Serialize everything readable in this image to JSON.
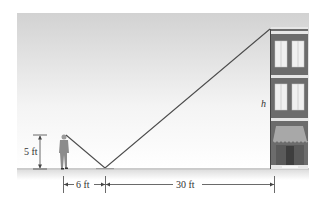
{
  "figure": {
    "type": "mirror-reflection similar triangles",
    "labels": {
      "person_height": "5 ft",
      "person_to_mirror": "6 ft",
      "mirror_to_building": "30 ft",
      "building_height": "h"
    },
    "colors": {
      "sky_top": "#d4d4d4",
      "sky_bottom": "#ffffff",
      "ground": "#e2e2e2",
      "building": "#6e6e6e",
      "building_trim": "#e8e8e8",
      "window": "#f2f2f2",
      "line": "#4a4a4a",
      "person": "#8a8a8a",
      "text": "#333333"
    }
  }
}
